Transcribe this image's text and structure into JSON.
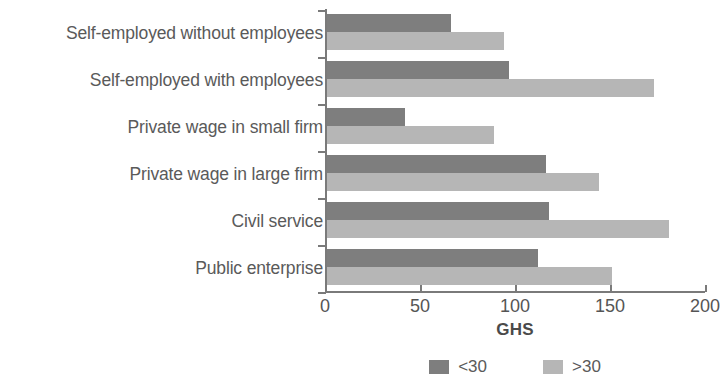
{
  "chart_data": {
    "type": "bar",
    "orientation": "horizontal",
    "title": "",
    "xlabel": "GHS",
    "ylabel": "",
    "xlim": [
      0,
      200
    ],
    "xticks": [
      0,
      50,
      100,
      150,
      200
    ],
    "grid": false,
    "legend_position": "bottom",
    "categories": [
      "Self-employed without employees",
      "Self-employed with employees",
      "Private wage in small firm",
      "Private wage in large firm",
      "Civil service",
      "Public enterprise"
    ],
    "series": [
      {
        "name": "<30",
        "color": "#7e7e7e",
        "values": [
          65,
          96,
          41,
          115,
          117,
          111
        ]
      },
      {
        "name": ">30",
        "color": "#b6b6b6",
        "values": [
          93,
          172,
          88,
          143,
          180,
          150
        ]
      }
    ]
  },
  "axis": {
    "tick_labels": [
      "0",
      "50",
      "100",
      "150",
      "200"
    ],
    "title": "GHS"
  },
  "legend": {
    "items": [
      {
        "label": "<30",
        "color": "#7e7e7e"
      },
      {
        "label": ">30",
        "color": "#b6b6b6"
      }
    ]
  }
}
